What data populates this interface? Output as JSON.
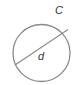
{
  "diagram": {
    "type": "circle",
    "labels": {
      "circumference": "C",
      "diameter": "d"
    },
    "colors": {
      "stroke": "#8a8a8a",
      "text": "#333333",
      "background": "#ffffff"
    }
  }
}
